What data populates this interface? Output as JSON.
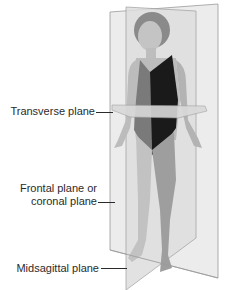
{
  "diagram": {
    "labels": {
      "transverse": "Transverse plane",
      "frontal_line1": "Frontal plane or",
      "frontal_line2": "coronal plane",
      "midsagittal": "Midsagittal plane"
    },
    "colors": {
      "plane_fill": "#e6e6e6",
      "plane_edge": "#9a9a9a",
      "skin": "#c9c9c9",
      "swimsuit_dark": "#1a1a1a",
      "swimsuit_mid": "#7a7a7a",
      "hair": "#8a8a8a",
      "label_text": "#2b2b2b"
    }
  }
}
